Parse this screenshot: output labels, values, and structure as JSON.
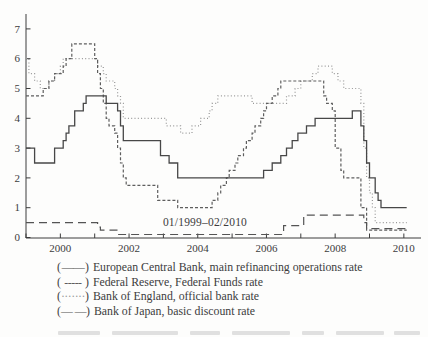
{
  "figure": {
    "background": "#fdfdfc",
    "axis_color": "#3c3c3c",
    "text_color": "#3c3c3c"
  },
  "chart_data": {
    "type": "line",
    "title": "",
    "xlabel": "",
    "ylabel": "",
    "annotation": "01/1999–02/2010",
    "x_axis": {
      "range": [
        "1999-01",
        "2010-02"
      ],
      "tick_years": [
        1999,
        2000,
        2001,
        2002,
        2003,
        2004,
        2005,
        2006,
        2007,
        2008,
        2009,
        2010
      ],
      "label_years": [
        2000,
        2002,
        2004,
        2006,
        2008,
        2010
      ]
    },
    "y_axis": {
      "range": [
        0,
        7
      ],
      "ticks": [
        0,
        1,
        2,
        3,
        4,
        5,
        6,
        7
      ]
    },
    "legend_parens": {
      "open": "(",
      "close": ")"
    },
    "legend_position": "below",
    "series": [
      {
        "name": "European Central Bank, main refinancing operations rate",
        "line_style": "solid",
        "marker": "——",
        "color": "#474747",
        "points": [
          [
            "1999-01",
            3.0
          ],
          [
            "1999-04",
            2.5
          ],
          [
            "1999-11",
            3.0
          ],
          [
            "2000-02",
            3.25
          ],
          [
            "2000-03",
            3.5
          ],
          [
            "2000-04",
            3.75
          ],
          [
            "2000-06",
            4.25
          ],
          [
            "2000-09",
            4.5
          ],
          [
            "2000-10",
            4.75
          ],
          [
            "2001-05",
            4.5
          ],
          [
            "2001-09",
            4.25
          ],
          [
            "2001-10",
            3.75
          ],
          [
            "2001-11",
            3.25
          ],
          [
            "2002-12",
            2.75
          ],
          [
            "2003-03",
            2.5
          ],
          [
            "2003-06",
            2.0
          ],
          [
            "2005-12",
            2.25
          ],
          [
            "2006-03",
            2.5
          ],
          [
            "2006-06",
            2.75
          ],
          [
            "2006-08",
            3.0
          ],
          [
            "2006-10",
            3.25
          ],
          [
            "2006-12",
            3.5
          ],
          [
            "2007-03",
            3.75
          ],
          [
            "2007-06",
            4.0
          ],
          [
            "2008-07",
            4.25
          ],
          [
            "2008-10",
            3.75
          ],
          [
            "2008-11",
            3.25
          ],
          [
            "2008-12",
            2.5
          ],
          [
            "2009-01",
            2.0
          ],
          [
            "2009-03",
            1.5
          ],
          [
            "2009-04",
            1.25
          ],
          [
            "2009-05",
            1.0
          ]
        ]
      },
      {
        "name": "Federal Reserve, Federal Funds rate",
        "line_style": "dashed",
        "marker": "-----",
        "color": "#5e5e5e",
        "points": [
          [
            "1999-01",
            4.75
          ],
          [
            "1999-07",
            5.0
          ],
          [
            "1999-09",
            5.25
          ],
          [
            "1999-11",
            5.5
          ],
          [
            "2000-02",
            5.75
          ],
          [
            "2000-03",
            6.0
          ],
          [
            "2000-05",
            6.5
          ],
          [
            "2001-01",
            6.0
          ],
          [
            "2001-02",
            5.5
          ],
          [
            "2001-03",
            5.0
          ],
          [
            "2001-04",
            4.5
          ],
          [
            "2001-05",
            4.0
          ],
          [
            "2001-06",
            3.75
          ],
          [
            "2001-08",
            3.5
          ],
          [
            "2001-09",
            3.0
          ],
          [
            "2001-10",
            2.5
          ],
          [
            "2001-11",
            2.0
          ],
          [
            "2001-12",
            1.75
          ],
          [
            "2002-11",
            1.25
          ],
          [
            "2003-06",
            1.0
          ],
          [
            "2004-06",
            1.25
          ],
          [
            "2004-08",
            1.5
          ],
          [
            "2004-09",
            1.75
          ],
          [
            "2004-11",
            2.0
          ],
          [
            "2004-12",
            2.25
          ],
          [
            "2005-02",
            2.5
          ],
          [
            "2005-03",
            2.75
          ],
          [
            "2005-05",
            3.0
          ],
          [
            "2005-06",
            3.25
          ],
          [
            "2005-08",
            3.5
          ],
          [
            "2005-09",
            3.75
          ],
          [
            "2005-11",
            4.0
          ],
          [
            "2005-12",
            4.25
          ],
          [
            "2006-01",
            4.5
          ],
          [
            "2006-03",
            4.75
          ],
          [
            "2006-05",
            5.0
          ],
          [
            "2006-06",
            5.25
          ],
          [
            "2007-09",
            4.75
          ],
          [
            "2007-10",
            4.5
          ],
          [
            "2007-12",
            4.25
          ],
          [
            "2008-01",
            3.0
          ],
          [
            "2008-03",
            2.25
          ],
          [
            "2008-04",
            2.0
          ],
          [
            "2008-10",
            1.0
          ],
          [
            "2008-12",
            0.25
          ]
        ]
      },
      {
        "name": "Bank of England, official bank rate",
        "line_style": "dotted",
        "marker": "·······",
        "color": "#989898",
        "points": [
          [
            "1999-01",
            6.0
          ],
          [
            "1999-02",
            5.5
          ],
          [
            "1999-04",
            5.25
          ],
          [
            "1999-06",
            5.0
          ],
          [
            "1999-09",
            5.25
          ],
          [
            "1999-11",
            5.5
          ],
          [
            "2000-01",
            5.75
          ],
          [
            "2000-02",
            6.0
          ],
          [
            "2001-02",
            5.75
          ],
          [
            "2001-04",
            5.5
          ],
          [
            "2001-05",
            5.25
          ],
          [
            "2001-08",
            5.0
          ],
          [
            "2001-09",
            4.75
          ],
          [
            "2001-10",
            4.5
          ],
          [
            "2001-11",
            4.0
          ],
          [
            "2003-02",
            3.75
          ],
          [
            "2003-07",
            3.5
          ],
          [
            "2003-11",
            3.75
          ],
          [
            "2004-02",
            4.0
          ],
          [
            "2004-05",
            4.25
          ],
          [
            "2004-06",
            4.5
          ],
          [
            "2004-08",
            4.75
          ],
          [
            "2005-08",
            4.5
          ],
          [
            "2006-08",
            4.75
          ],
          [
            "2006-11",
            5.0
          ],
          [
            "2007-01",
            5.25
          ],
          [
            "2007-05",
            5.5
          ],
          [
            "2007-07",
            5.75
          ],
          [
            "2007-12",
            5.5
          ],
          [
            "2008-02",
            5.25
          ],
          [
            "2008-04",
            5.0
          ],
          [
            "2008-10",
            4.5
          ],
          [
            "2008-11",
            3.0
          ],
          [
            "2008-12",
            2.0
          ],
          [
            "2009-01",
            1.5
          ],
          [
            "2009-02",
            1.0
          ],
          [
            "2009-03",
            0.5
          ]
        ]
      },
      {
        "name": "Bank of Japan, basic discount rate",
        "line_style": "longdash",
        "marker": "— —",
        "color": "#545454",
        "points": [
          [
            "1999-01",
            0.5
          ],
          [
            "2001-02",
            0.35
          ],
          [
            "2001-03",
            0.25
          ],
          [
            "2001-09",
            0.1
          ],
          [
            "2006-07",
            0.4
          ],
          [
            "2007-02",
            0.75
          ],
          [
            "2008-11",
            0.5
          ],
          [
            "2008-12",
            0.3
          ]
        ]
      }
    ]
  }
}
